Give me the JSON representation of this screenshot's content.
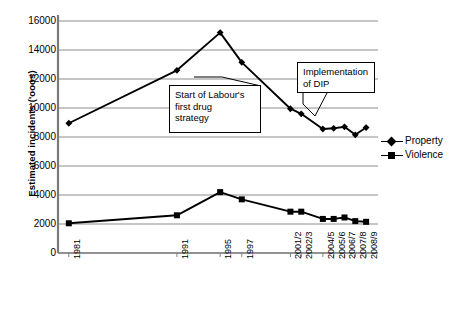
{
  "chart_data": {
    "type": "line",
    "title": "",
    "xlabel": "",
    "ylabel": "Estimated incidents ('ooos)",
    "ylim": [
      0,
      16000
    ],
    "ytick_labels": [
      "0",
      "2000",
      "4000",
      "6000",
      "8000",
      "10000",
      "12000",
      "14000",
      "16000"
    ],
    "ytick_values": [
      0,
      2000,
      4000,
      6000,
      8000,
      10000,
      12000,
      14000,
      16000
    ],
    "grid": true,
    "legend_position": "right",
    "categories": [
      "1981",
      "1991",
      "1995",
      "1997",
      "2001/2",
      "2002/3",
      "2004/5",
      "2005/6",
      "2006/7",
      "2007/8",
      "2008/9"
    ],
    "x": [
      1981,
      1991,
      1995,
      1997,
      2001.5,
      2002.5,
      2004.5,
      2005.5,
      2006.5,
      2007.5,
      2008.5
    ],
    "series": [
      {
        "name": "Property",
        "marker": "diamond",
        "values": [
          8950,
          12600,
          15200,
          13150,
          9950,
          9600,
          8550,
          8600,
          8700,
          8150,
          8650
        ]
      },
      {
        "name": "Violence",
        "marker": "square",
        "values": [
          2050,
          2600,
          4200,
          3700,
          2850,
          2850,
          2350,
          2350,
          2450,
          2200,
          2150
        ]
      }
    ],
    "annotations": [
      {
        "id": "labour-drug-strategy",
        "text": "Start of Labour's first drug strategy",
        "lines": [
          "Start of Labour's",
          "first drug",
          "strategy"
        ],
        "points_to": 1997
      },
      {
        "id": "implementation-of-dip",
        "text": "Implementation of DIP",
        "lines": [
          "Implementation",
          "of DIP"
        ],
        "points_to": 2002.5
      }
    ]
  }
}
